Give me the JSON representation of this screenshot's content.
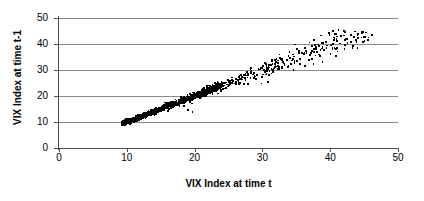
{
  "chart_data": {
    "type": "scatter",
    "title": "",
    "xlabel": "VIX Index at time t",
    "ylabel": "VIX Index at time t-1",
    "xlim": [
      0,
      50
    ],
    "ylim": [
      0,
      50
    ],
    "xticks": [
      "0",
      "10",
      "20",
      "30",
      "40",
      "50"
    ],
    "yticks": [
      "0",
      "10",
      "20",
      "30",
      "40",
      "50"
    ],
    "xtick_values": [
      0,
      10,
      20,
      30,
      40,
      50
    ],
    "ytick_values": [
      0,
      10,
      20,
      30,
      40,
      50
    ],
    "grid": "horizontal",
    "grid_color": "#8a8a8a",
    "axis_color": "#4d4d4d",
    "point_color": "#000000",
    "legend": "none",
    "series": [
      {
        "name": "VIX lag-1 pairs",
        "marker": "square",
        "marker_size": 1.7,
        "n_points_drawn": 1700,
        "x_range": [
          9.3,
          46.2
        ],
        "y_range": [
          9.2,
          45.3
        ],
        "generator": {
          "model": "diagonal-band",
          "x_distribution": "right-skewed, mode near 14, long tail to 46",
          "y_given_x": "y = x + noise; noise sd grows from 0.45 at x=10 to 3.2 at x=45",
          "seed": 20240617,
          "outlier_fraction": 0.012,
          "outlier_offset_range": [
            -6.5,
            -2.0
          ]
        }
      }
    ]
  },
  "axes": {
    "x_title": "VIX Index at time t",
    "y_title": "VIX Index at time t-1"
  }
}
